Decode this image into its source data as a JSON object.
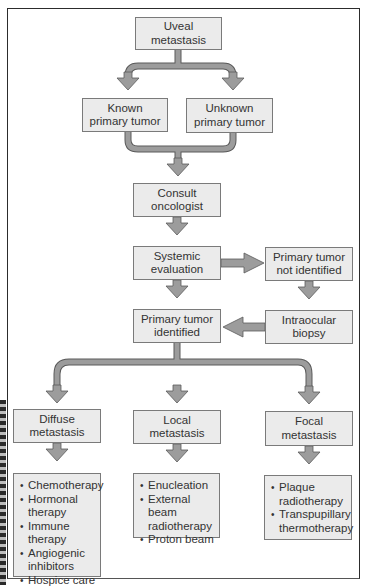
{
  "diagram": {
    "type": "flowchart",
    "nodes": {
      "uveal": {
        "lines": [
          "Uveal metastasis"
        ]
      },
      "known": {
        "lines": [
          "Known",
          "primary tumor"
        ]
      },
      "unknown": {
        "lines": [
          "Unknown",
          "primary tumor"
        ]
      },
      "consult": {
        "lines": [
          "Consult",
          "oncologist"
        ]
      },
      "systemic": {
        "lines": [
          "Systemic",
          "evaluation"
        ]
      },
      "not_identified": {
        "lines": [
          "Primary tumor",
          "not identified"
        ]
      },
      "identified": {
        "lines": [
          "Primary tumor",
          "identified"
        ]
      },
      "biopsy": {
        "lines": [
          "Intraocular",
          "biopsy"
        ]
      },
      "diffuse": {
        "lines": [
          "Diffuse",
          "metastasis"
        ]
      },
      "local": {
        "lines": [
          "Local",
          "metastasis"
        ]
      },
      "focal": {
        "lines": [
          "Focal",
          "metastasis"
        ]
      }
    },
    "treatments": {
      "diffuse": [
        "Chemotherapy",
        "Hormonal therapy",
        "Immune therapy",
        "Angiogenic inhibitors",
        "Hospice care"
      ],
      "local": [
        "Enucleation",
        "External beam radiotherapy",
        "Proton beam"
      ],
      "focal": [
        "Plaque radiotherapy",
        "Transpupillary thermotherapy"
      ]
    },
    "edges": [
      [
        "Uveal metastasis",
        "Known primary tumor"
      ],
      [
        "Uveal metastasis",
        "Unknown primary tumor"
      ],
      [
        "Known primary tumor",
        "Consult oncologist"
      ],
      [
        "Unknown primary tumor",
        "Consult oncologist"
      ],
      [
        "Consult oncologist",
        "Systemic evaluation"
      ],
      [
        "Systemic evaluation",
        "Primary tumor not identified"
      ],
      [
        "Systemic evaluation",
        "Primary tumor identified"
      ],
      [
        "Primary tumor not identified",
        "Intraocular biopsy"
      ],
      [
        "Intraocular biopsy",
        "Primary tumor identified"
      ],
      [
        "Primary tumor identified",
        "Diffuse metastasis"
      ],
      [
        "Primary tumor identified",
        "Local metastasis"
      ],
      [
        "Primary tumor identified",
        "Focal metastasis"
      ],
      [
        "Diffuse metastasis",
        "Diffuse treatments"
      ],
      [
        "Local metastasis",
        "Local treatments"
      ],
      [
        "Focal metastasis",
        "Focal treatments"
      ]
    ],
    "colors": {
      "box_fill": "#ebebeb",
      "box_border": "#7a7a7a",
      "arrow_fill": "#9c9c9c",
      "arrow_outline": "#5a5a5a",
      "text": "#333333"
    }
  }
}
